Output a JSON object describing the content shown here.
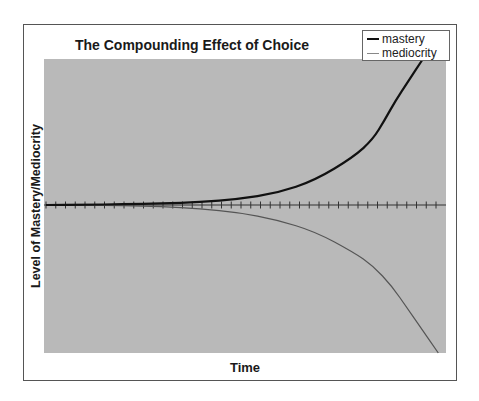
{
  "chart_data": {
    "type": "line",
    "title": "The Compounding Effect of Choice",
    "xlabel": "Time",
    "ylabel": "Level of Mastery/Mediocrity",
    "x_ticks_count": 40,
    "x_tick_labels": [],
    "y_tick_labels": [],
    "grid": false,
    "legend_position": "top-right",
    "plot_background": "#b9b9b9",
    "series": [
      {
        "name": "mastery",
        "color": "#111111",
        "line_width": 2.2,
        "points": [
          [
            0,
            0
          ],
          [
            5,
            0.2
          ],
          [
            10,
            0.5
          ],
          [
            15,
            1
          ],
          [
            20,
            2
          ],
          [
            25,
            4
          ],
          [
            30,
            8
          ],
          [
            35,
            17
          ],
          [
            40,
            33
          ],
          [
            42.5,
            45
          ],
          [
            44,
            58
          ],
          [
            45.5,
            72
          ],
          [
            47,
            84
          ],
          [
            49,
            100
          ]
        ]
      },
      {
        "name": "mediocrity",
        "color": "#555555",
        "line_width": 1.2,
        "points": [
          [
            0,
            0
          ],
          [
            5,
            -0.2
          ],
          [
            10,
            -0.5
          ],
          [
            15,
            -1
          ],
          [
            20,
            -2.5
          ],
          [
            25,
            -5
          ],
          [
            30,
            -10
          ],
          [
            35,
            -18
          ],
          [
            40,
            -32
          ],
          [
            42.5,
            -41
          ],
          [
            45,
            -55
          ],
          [
            47,
            -70
          ],
          [
            49,
            -85
          ],
          [
            51,
            -100
          ]
        ]
      }
    ],
    "xlim": [
      0,
      52
    ],
    "ylim": [
      -100,
      100
    ]
  },
  "legend": {
    "items": [
      {
        "label": "mastery",
        "color": "#111111"
      },
      {
        "label": "mediocrity",
        "color": "#888888"
      }
    ]
  }
}
